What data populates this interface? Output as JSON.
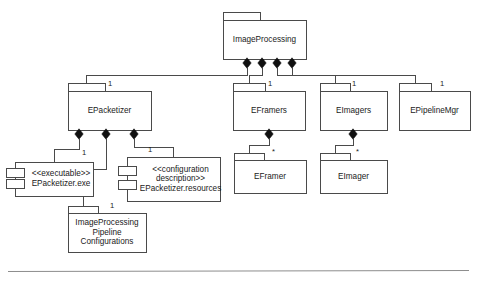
{
  "diagram": {
    "notation": "UML package/component composition diagram",
    "canvas": {
      "width": 477,
      "height": 286
    },
    "colors": {
      "background": "#ffffff",
      "node_fill": "#ffffff",
      "node_stroke": "#4a4a4a",
      "diamond": "#101010",
      "text": "#1a1a1a",
      "rule": "#8d8d8d"
    },
    "nodes": [
      {
        "id": "image-processing",
        "kind": "package",
        "lines": [
          "ImageProcessing"
        ],
        "x": 223,
        "y": 20,
        "w": 83,
        "h": 39,
        "tab_w": 37,
        "tab_h": 8
      },
      {
        "id": "epacketizer",
        "kind": "package",
        "lines": [
          "EPacketizer"
        ],
        "x": 68,
        "y": 91,
        "w": 83,
        "h": 39,
        "tab_w": 37,
        "tab_h": 8
      },
      {
        "id": "eframers",
        "kind": "package",
        "lines": [
          "EFramers"
        ],
        "x": 233,
        "y": 91,
        "w": 72,
        "h": 39,
        "tab_w": 32,
        "tab_h": 8
      },
      {
        "id": "eimagers",
        "kind": "package",
        "lines": [
          "EImagers"
        ],
        "x": 320,
        "y": 91,
        "w": 67,
        "h": 39,
        "tab_w": 30,
        "tab_h": 8
      },
      {
        "id": "epipelinemgr",
        "kind": "package",
        "lines": [
          "EPipelineMgr"
        ],
        "x": 399,
        "y": 91,
        "w": 71,
        "h": 39,
        "tab_w": 32,
        "tab_h": 8
      },
      {
        "id": "epacketizer-exe",
        "kind": "component",
        "lines": [
          "<<executable>>",
          "EPacketizer.exe"
        ],
        "x": 15,
        "y": 162,
        "w": 78,
        "h": 34
      },
      {
        "id": "epacketizer-resources",
        "kind": "component",
        "lines": [
          "<<configuration",
          "description>>",
          "EPacketizer.resources"
        ],
        "x": 127,
        "y": 157,
        "w": 93,
        "h": 44
      },
      {
        "id": "ip-pipeline-configurations",
        "kind": "package",
        "lines": [
          "ImageProcessing",
          "Pipeline",
          "Configurations"
        ],
        "x": 68,
        "y": 213,
        "w": 78,
        "h": 39,
        "tab_w": 30,
        "tab_h": 7
      },
      {
        "id": "eframer",
        "kind": "package",
        "lines": [
          "EFramer"
        ],
        "x": 234,
        "y": 160,
        "w": 72,
        "h": 33,
        "tab_w": 30,
        "tab_h": 7
      },
      {
        "id": "eimager",
        "kind": "package",
        "lines": [
          "EImager"
        ],
        "x": 320,
        "y": 160,
        "w": 67,
        "h": 33,
        "tab_w": 30,
        "tab_h": 7
      }
    ],
    "compositions": [
      {
        "from": "image-processing",
        "to": "epacketizer",
        "multiplicity": "1",
        "diamond": {
          "x": 247,
          "y": 63
        }
      },
      {
        "from": "image-processing",
        "to": "eframers",
        "multiplicity": "1",
        "diamond": {
          "x": 262,
          "y": 63
        }
      },
      {
        "from": "image-processing",
        "to": "eimagers",
        "multiplicity": "1",
        "diamond": {
          "x": 277,
          "y": 63
        }
      },
      {
        "from": "image-processing",
        "to": "epipelinemgr",
        "multiplicity": "1",
        "diamond": {
          "x": 292,
          "y": 63
        }
      },
      {
        "from": "epacketizer",
        "to": "epacketizer-exe",
        "multiplicity": "1",
        "diamond": {
          "x": 79,
          "y": 134
        }
      },
      {
        "from": "epacketizer",
        "to": "ip-pipeline-configurations",
        "multiplicity": "1",
        "diamond": {
          "x": 106,
          "y": 134
        }
      },
      {
        "from": "epacketizer",
        "to": "epacketizer-resources",
        "multiplicity": "1",
        "diamond": {
          "x": 134,
          "y": 134
        }
      },
      {
        "from": "eframers",
        "to": "eframer",
        "multiplicity": "*",
        "diamond": {
          "x": 269,
          "y": 134
        }
      },
      {
        "from": "eimagers",
        "to": "eimager",
        "multiplicity": "*",
        "diamond": {
          "x": 353,
          "y": 134
        }
      }
    ],
    "multiplicity_labels": [
      {
        "text": "1",
        "x": 108,
        "y": 84
      },
      {
        "text": "1",
        "x": 268,
        "y": 84
      },
      {
        "text": "1",
        "x": 352,
        "y": 84
      },
      {
        "text": "1",
        "x": 440,
        "y": 84
      },
      {
        "text": "1",
        "x": 82,
        "y": 153
      },
      {
        "text": "1",
        "x": 148,
        "y": 150
      },
      {
        "text": "1",
        "x": 110,
        "y": 206
      },
      {
        "text": "*",
        "x": 272,
        "y": 152
      },
      {
        "text": "*",
        "x": 356,
        "y": 152
      }
    ],
    "footer_rule": {
      "x1": 8,
      "y1": 271,
      "x2": 469,
      "y2": 270
    }
  }
}
